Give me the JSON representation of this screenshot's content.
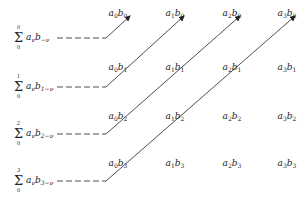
{
  "diagram": {
    "title": "",
    "line_color": "#222222",
    "sums": [
      {
        "upper": "0",
        "lower": "0",
        "a": "a",
        "a_sub": "ν",
        "b": "b",
        "b_sub": "−ν",
        "label": "Σ₀⁰ aνb−ν"
      },
      {
        "upper": "1",
        "lower": "0",
        "a": "a",
        "a_sub": "ν",
        "b": "b",
        "b_sub": "1−ν",
        "label": "Σ₀¹ aνb1−ν"
      },
      {
        "upper": "2",
        "lower": "0",
        "a": "a",
        "a_sub": "ν",
        "b": "b",
        "b_sub": "2−ν",
        "label": "Σ₀² aνb2−ν"
      },
      {
        "upper": "3",
        "lower": "0",
        "a": "a",
        "a_sub": "ν",
        "b": "b",
        "b_sub": "3−ν",
        "label": "Σ₀³ aνb3−ν"
      }
    ],
    "grid": {
      "rows": [
        [
          {
            "a": "0",
            "b": "0"
          },
          {
            "a": "1",
            "b": "0"
          },
          {
            "a": "2",
            "b": "0"
          },
          {
            "a": "3",
            "b": "0"
          }
        ],
        [
          {
            "a": "0",
            "b": "1"
          },
          {
            "a": "1",
            "b": "1"
          },
          {
            "a": "2",
            "b": "1"
          },
          {
            "a": "3",
            "b": "1"
          }
        ],
        [
          {
            "a": "0",
            "b": "2"
          },
          {
            "a": "1",
            "b": "2"
          },
          {
            "a": "2",
            "b": "2"
          },
          {
            "a": "3",
            "b": "2"
          }
        ],
        [
          {
            "a": "0",
            "b": "3"
          },
          {
            "a": "1",
            "b": "3"
          },
          {
            "a": "2",
            "b": "3"
          },
          {
            "a": "3",
            "b": "3"
          }
        ]
      ]
    }
  }
}
